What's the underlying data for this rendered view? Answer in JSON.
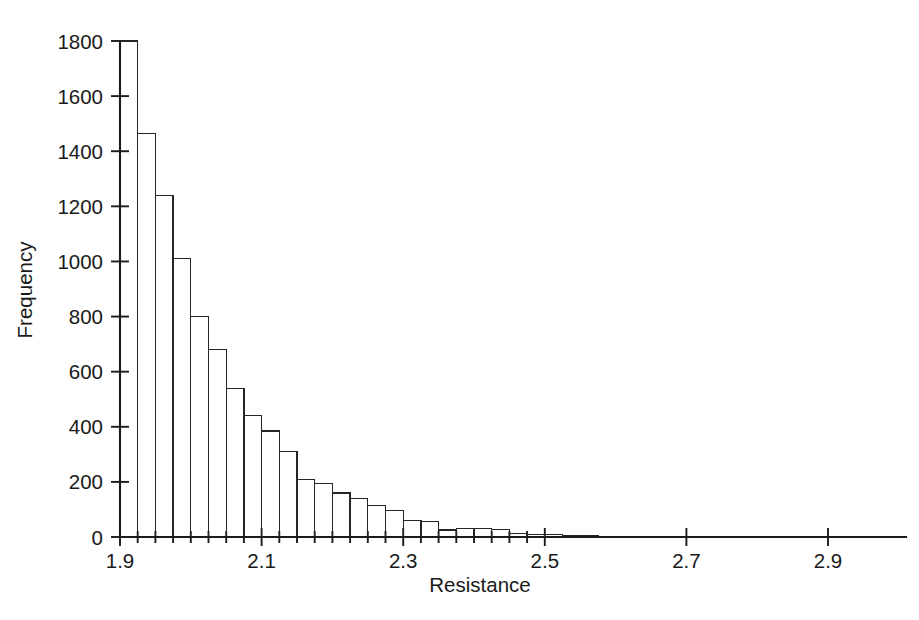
{
  "chart_data": {
    "type": "bar",
    "title": "",
    "subtitle": "",
    "xlabel": "Resistance",
    "ylabel": "Frequency",
    "xlim": [
      1.895,
      2.955
    ],
    "ylim": [
      0,
      1800
    ],
    "grid": false,
    "legend": null,
    "bin_width": 0.025,
    "bin_start": 1.9,
    "x_ticks": [
      {
        "value": 1.9,
        "label": "1.9"
      },
      {
        "value": 2.1,
        "label": "2.1"
      },
      {
        "value": 2.3,
        "label": "2.3"
      },
      {
        "value": 2.5,
        "label": "2.5"
      },
      {
        "value": 2.7,
        "label": "2.7"
      },
      {
        "value": 2.9,
        "label": "2.9"
      }
    ],
    "x_minor_ticks": [
      1.925,
      1.95,
      1.975,
      2.0,
      2.025,
      2.05,
      2.075,
      2.125,
      2.15,
      2.175,
      2.2,
      2.225,
      2.25,
      2.275,
      2.325,
      2.35,
      2.375,
      2.4,
      2.425,
      2.45,
      2.475
    ],
    "y_ticks": [
      {
        "value": 0,
        "label": "0"
      },
      {
        "value": 200,
        "label": "200"
      },
      {
        "value": 400,
        "label": "400"
      },
      {
        "value": 600,
        "label": "600"
      },
      {
        "value": 800,
        "label": "800"
      },
      {
        "value": 1000,
        "label": "1000"
      },
      {
        "value": 1200,
        "label": "1200"
      },
      {
        "value": 1400,
        "label": "1400"
      },
      {
        "value": 1600,
        "label": "1600"
      },
      {
        "value": 1800,
        "label": "1800"
      }
    ],
    "categories": [
      "1.900",
      "1.925",
      "1.950",
      "1.975",
      "2.000",
      "2.025",
      "2.050",
      "2.075",
      "2.100",
      "2.125",
      "2.150",
      "2.175",
      "2.200",
      "2.225",
      "2.250",
      "2.275",
      "2.300",
      "2.325",
      "2.350",
      "2.375",
      "2.400",
      "2.425",
      "2.450",
      "2.475",
      "2.500",
      "2.525",
      "2.550",
      "2.575",
      "2.600",
      "2.625",
      "2.650",
      "2.675",
      "2.700",
      "2.725",
      "2.750",
      "2.775",
      "2.800",
      "2.825",
      "2.850",
      "2.875",
      "2.900",
      "2.925"
    ],
    "values": [
      1800,
      1465,
      1240,
      1010,
      800,
      680,
      540,
      440,
      385,
      310,
      210,
      195,
      160,
      140,
      115,
      95,
      60,
      55,
      25,
      30,
      30,
      28,
      12,
      10,
      8,
      5,
      4,
      3,
      2,
      2,
      1,
      1,
      1,
      1,
      0,
      0,
      0,
      0,
      0,
      0,
      0,
      0
    ],
    "colors": {
      "bar_stroke": "#262626",
      "bar_fill": "none",
      "axis": "#1c1c1c",
      "text": "#1a1a1a",
      "background": "#ffffff"
    }
  }
}
